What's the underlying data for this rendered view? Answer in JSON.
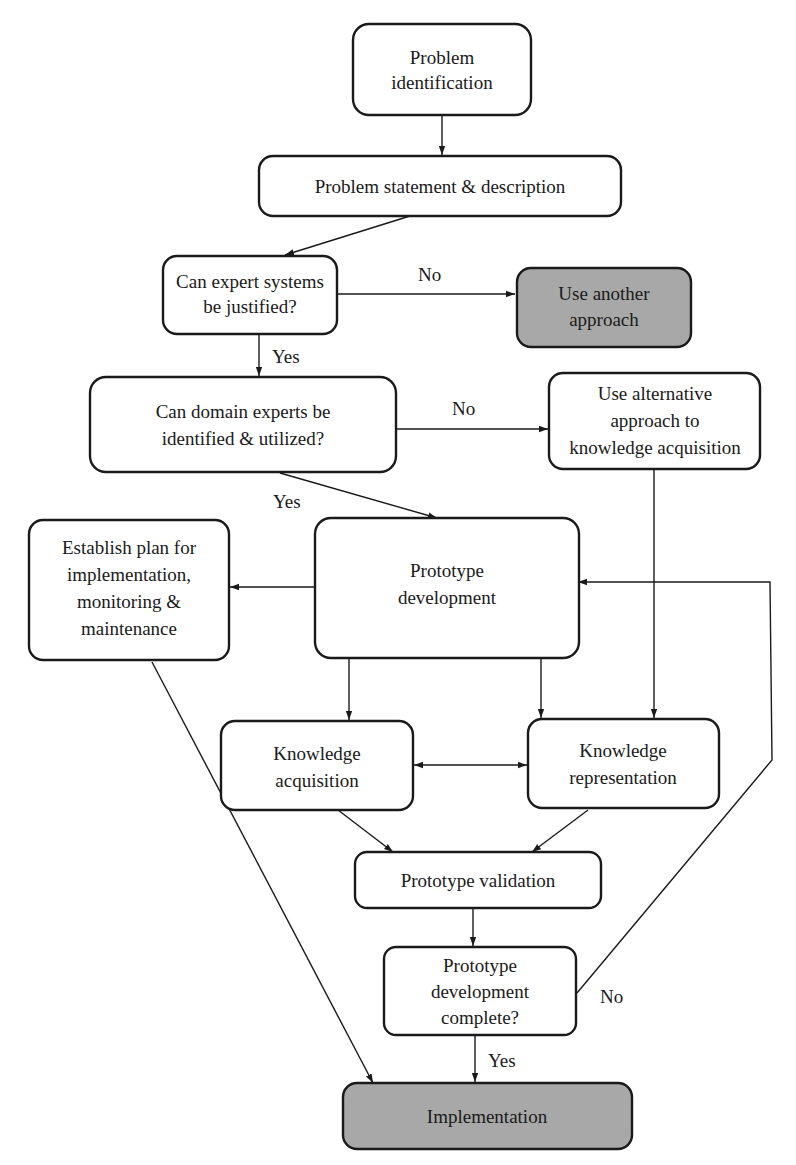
{
  "colors": {
    "stroke": "#1a1a1a",
    "box_fill": "#ffffff",
    "terminal_fill": "#a8a8a8"
  },
  "nodes": {
    "problem_identification": {
      "lines": [
        "Problem",
        "identification"
      ]
    },
    "problem_statement": {
      "lines": [
        "Problem statement & description"
      ]
    },
    "expert_systems_justified": {
      "lines": [
        "Can expert systems",
        "be justified?"
      ]
    },
    "use_another_approach": {
      "lines": [
        "Use another",
        "approach"
      ]
    },
    "domain_experts": {
      "lines": [
        "Can domain experts be",
        "identified & utilized?"
      ]
    },
    "alternative_approach": {
      "lines": [
        "Use alternative",
        "approach to",
        "knowledge acquisition"
      ]
    },
    "establish_plan": {
      "lines": [
        "Establish plan for",
        "implementation,",
        "monitoring &",
        "maintenance"
      ]
    },
    "prototype_development": {
      "lines": [
        "Prototype",
        "development"
      ]
    },
    "knowledge_acquisition": {
      "lines": [
        "Knowledge",
        "acquisition"
      ]
    },
    "knowledge_representation": {
      "lines": [
        "Knowledge",
        "representation"
      ]
    },
    "prototype_validation": {
      "lines": [
        "Prototype validation"
      ]
    },
    "development_complete": {
      "lines": [
        "Prototype",
        "development",
        "complete?"
      ]
    },
    "implementation": {
      "lines": [
        "Implementation"
      ]
    }
  },
  "edge_labels": {
    "justified_no": "No",
    "justified_yes": "Yes",
    "experts_no": "No",
    "experts_yes": "Yes",
    "complete_no": "No",
    "complete_yes": "Yes"
  }
}
